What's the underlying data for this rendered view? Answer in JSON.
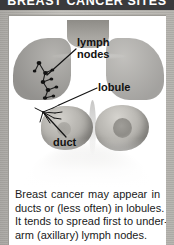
{
  "header": {
    "title": "BREAST CANCER SITES",
    "background_color": "#3a3a3c",
    "text_color": "#ffffff"
  },
  "frame": {
    "border_color": "#b5b3ae",
    "panel_background": "#ffffff"
  },
  "illustration": {
    "name": "female-torso-anatomy",
    "description": "Grayscale medical illustration of a female torso from the neck down, showing both breasts with internal lymph node chain and duct structures on the viewer-left side",
    "labels": [
      {
        "id": "lymph-nodes",
        "line1": "lymph",
        "line2": "nodes"
      },
      {
        "id": "lobule",
        "text": "lobule"
      },
      {
        "id": "duct",
        "text": "duct"
      }
    ],
    "label_color": "#111111"
  },
  "caption": {
    "lines": [
      {
        "justify": true,
        "words": [
          "Breast",
          "cancer",
          "may",
          "appear",
          "in"
        ]
      },
      {
        "justify": false,
        "text": "ducts or (less often) in lobules."
      },
      {
        "justify": false,
        "text": "It tends to spread first to under-"
      },
      {
        "justify": false,
        "text": "arm (axillary) lymph nodes."
      }
    ],
    "text_color": "#1a1a1a",
    "full_text": "Breast cancer may appear in ducts or (less often) in lobules. It tends to spread first to underarm (axillary) lymph nodes."
  }
}
